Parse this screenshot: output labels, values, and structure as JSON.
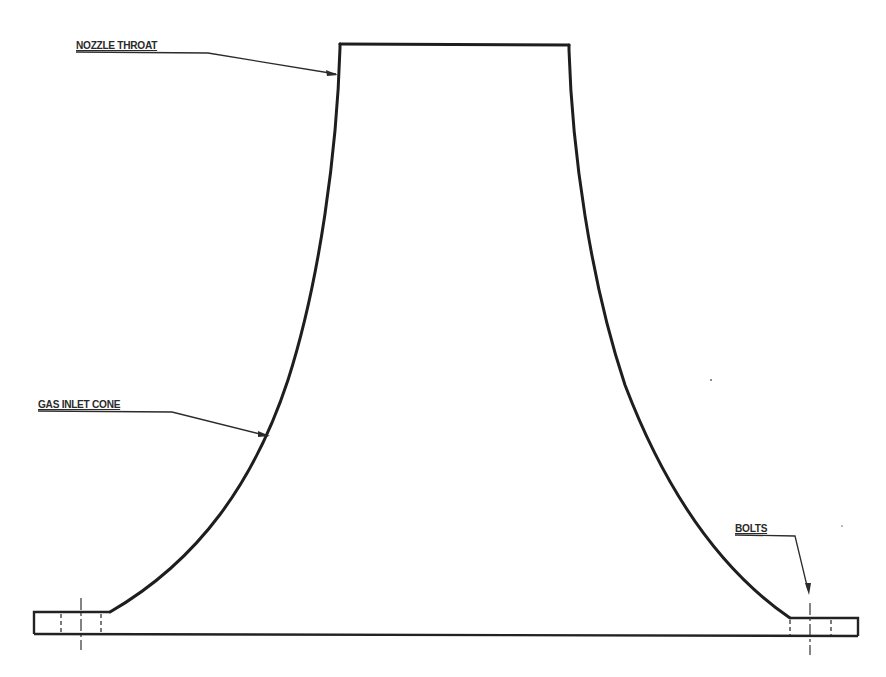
{
  "diagram": {
    "title": "",
    "type": "engineering cross-section drawing",
    "background_color": "#ffffff",
    "line_color": "#1e1e1e",
    "labels": {
      "nozzle_throat": "NOZZLE THROAT",
      "gas_inlet_cone": "GAS INLET CONE",
      "bolts": "BOLTS"
    },
    "components": [
      {
        "name": "nozzle-throat",
        "description": "Rectangular straight throat section at top"
      },
      {
        "name": "gas-inlet-cone",
        "description": "Flared curved walls widening downward"
      },
      {
        "name": "flange-left",
        "description": "Left base flange with bolt hole (dashed) and centerline"
      },
      {
        "name": "flange-right",
        "description": "Right base flange with bolt hole (dashed) and centerline"
      },
      {
        "name": "base-line",
        "description": "Bottom baseline across full width"
      }
    ]
  }
}
